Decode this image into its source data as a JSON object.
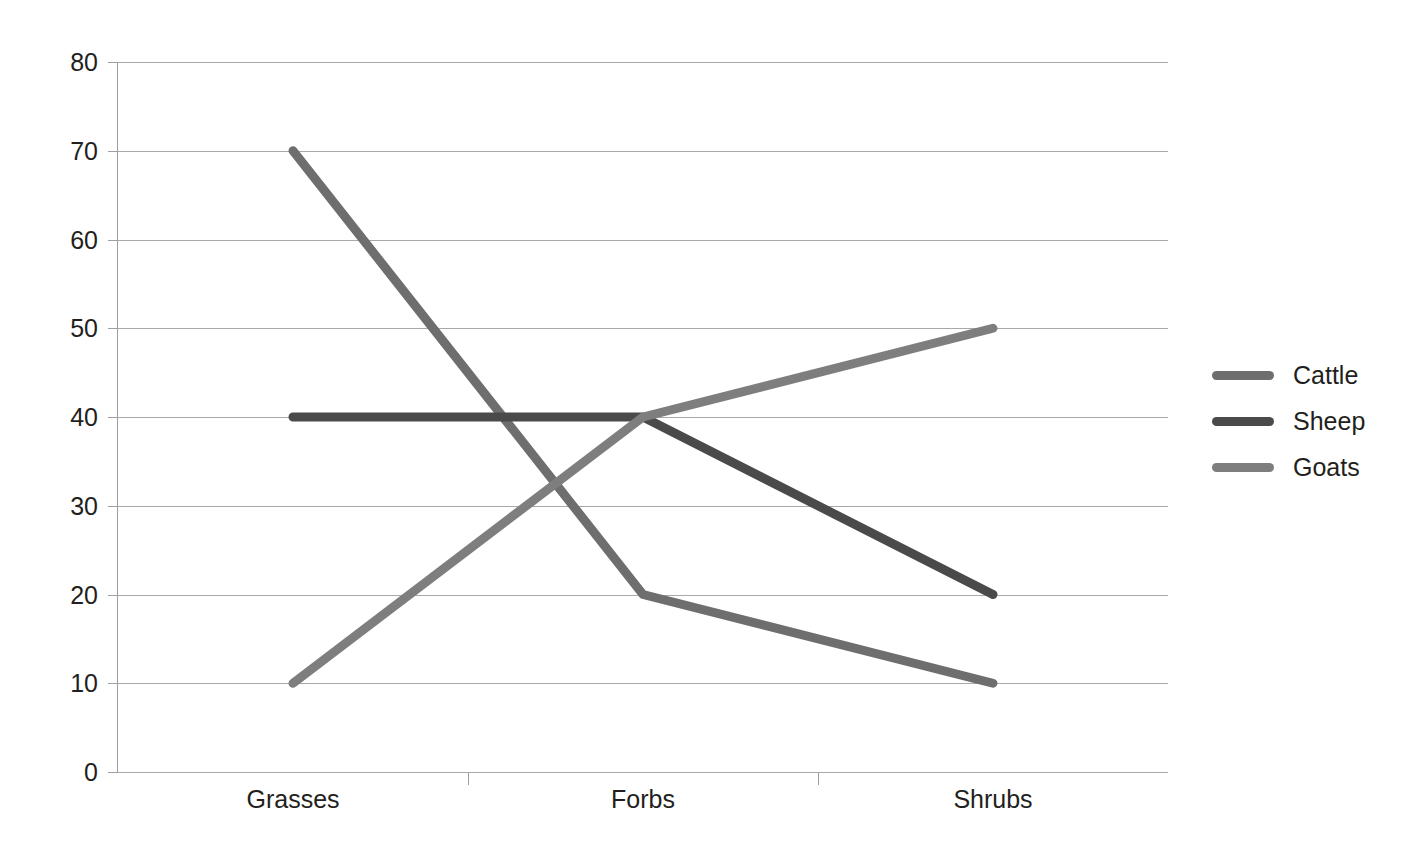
{
  "chart_data": {
    "type": "line",
    "title": "",
    "subtitle": "",
    "xlabel": "",
    "ylabel": "",
    "categories": [
      "Grasses",
      "Forbs",
      "Shrubs"
    ],
    "series": [
      {
        "name": "Cattle",
        "values": [
          70,
          20,
          10
        ],
        "color": "#6e6e6e"
      },
      {
        "name": "Sheep",
        "values": [
          40,
          40,
          20
        ],
        "color": "#4a4a4a"
      },
      {
        "name": "Goats",
        "values": [
          10,
          40,
          50
        ],
        "color": "#7e7e7e"
      }
    ],
    "ylim": [
      0,
      80
    ],
    "ytick_step": 10,
    "yticks": [
      0,
      10,
      20,
      30,
      40,
      50,
      60,
      70,
      80
    ],
    "ytick_labels": [
      "0",
      "10",
      "20",
      "30",
      "40",
      "50",
      "60",
      "70",
      "80"
    ],
    "grid": {
      "horizontal": true,
      "vertical": false,
      "color": "#a9a9a9"
    },
    "legend": {
      "position": "right",
      "entries": [
        "Cattle",
        "Sheep",
        "Goats"
      ]
    },
    "annotations": [],
    "background": "#ffffff",
    "line_width": 9
  },
  "axes": {
    "y_axis_color": "#9e9e9e",
    "x_axis_color": "#9e9e9e"
  }
}
